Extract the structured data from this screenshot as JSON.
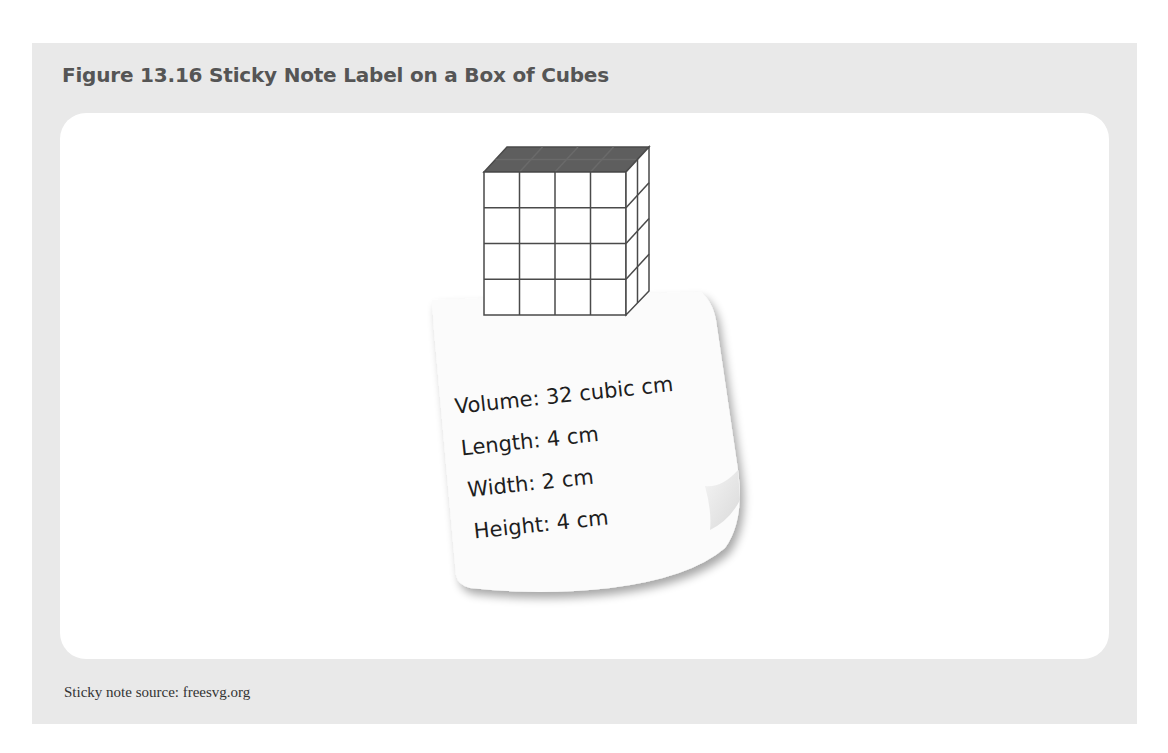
{
  "figure": {
    "title": "Figure 13.16 Sticky Note Label on a Box of Cubes",
    "source": "Sticky note source: freesvg.org"
  },
  "box": {
    "front_columns": 4,
    "front_rows": 4,
    "depth": 2,
    "top_color": "#5e5e5e",
    "line_color": "#4a4a4a"
  },
  "sticky_note": {
    "lines": [
      "Volume: 32 cubic cm",
      "Length: 4 cm",
      "Width: 2 cm",
      "Height: 4 cm"
    ]
  },
  "colors": {
    "panel_bg": "#e9e9e9",
    "card_bg": "#ffffff",
    "title_color": "#555555"
  }
}
